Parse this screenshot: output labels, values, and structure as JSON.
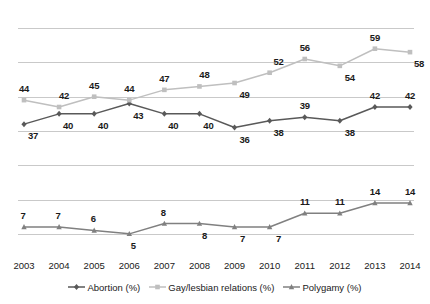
{
  "chart_data": {
    "type": "line",
    "title": "",
    "subtitle": "",
    "xlabel": "",
    "ylabel": "",
    "categories": [
      "2003",
      "2004",
      "2005",
      "2006",
      "2007",
      "2008",
      "2009",
      "2010",
      "2011",
      "2012",
      "2013",
      "2014"
    ],
    "ylim": [
      0,
      70
    ],
    "grid": true,
    "grid_values": [
      65,
      55,
      45,
      35,
      25,
      15,
      5
    ],
    "axis_line": false,
    "y_tick_labels": [],
    "legend_position": "bottom-center",
    "data_labels": true,
    "series": [
      {
        "name": "Abortion (%)",
        "label": "Abortion (%)",
        "color": "#595959",
        "marker": "diamond",
        "values": [
          37,
          40,
          40,
          43,
          40,
          40,
          36,
          38,
          39,
          38,
          42,
          42
        ]
      },
      {
        "name": "Gay/lesbian relations (%)",
        "label": "Gay/lesbian relations (%)",
        "color": "#bfbfbf",
        "marker": "square",
        "values": [
          44,
          42,
          45,
          44,
          47,
          48,
          49,
          52,
          56,
          54,
          59,
          58
        ]
      },
      {
        "name": "Polygamy (%)",
        "label": "Polygamy (%)",
        "color": "#808080",
        "marker": "triangle",
        "values": [
          7,
          7,
          6,
          5,
          8,
          8,
          7,
          7,
          11,
          11,
          14,
          14
        ]
      }
    ]
  },
  "colors": {
    "gridline": "#c9c9c9",
    "text": "#1a1a1a",
    "background": "#ffffff",
    "abortion": "#595959",
    "gay_lesbian": "#bfbfbf",
    "polygamy": "#808080"
  }
}
